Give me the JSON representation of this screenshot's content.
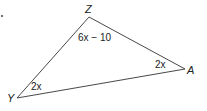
{
  "figure": {
    "type": "triangle",
    "vertices": [
      {
        "name": "Z",
        "x": 89,
        "y": 17
      },
      {
        "name": "Y",
        "x": 17,
        "y": 98
      },
      {
        "name": "A",
        "x": 185,
        "y": 69
      }
    ],
    "angles": {
      "Z": "6x − 10",
      "Y": "2x",
      "A": "2x"
    },
    "stroke_color": "#333333",
    "marker": "."
  }
}
